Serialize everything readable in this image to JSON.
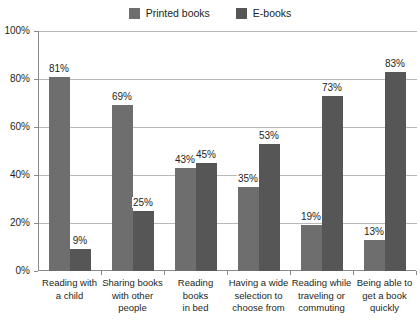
{
  "legend": {
    "items": [
      {
        "label": "Printed books",
        "color": "#6e6e6e",
        "swatch_name": "legend-swatch-printed"
      },
      {
        "label": "E-books",
        "color": "#565656",
        "swatch_name": "legend-swatch-ebooks"
      }
    ]
  },
  "axis": {
    "y_ticks": [
      "0%",
      "20%",
      "40%",
      "60%",
      "80%",
      "100%"
    ]
  },
  "chart_data": {
    "type": "bar",
    "title": "",
    "subtitle": "",
    "xlabel": "",
    "ylabel": "",
    "ylim": [
      0,
      100
    ],
    "grid": true,
    "legend_position": "top-center",
    "categories": [
      "Reading with a child",
      "Sharing books with other people",
      "Reading books in bed",
      "Having a wide selection to choose from",
      "Reading while traveling or commuting",
      "Being able to get a book quickly"
    ],
    "category_lines": [
      [
        "Reading with",
        "a child"
      ],
      [
        "Sharing books",
        "with other",
        "people"
      ],
      [
        "Reading books",
        "in bed"
      ],
      [
        "Having a wide",
        "selection to",
        "choose from"
      ],
      [
        "Reading while",
        "traveling or",
        "commuting"
      ],
      [
        "Being able to",
        "get a book",
        "quickly"
      ]
    ],
    "series": [
      {
        "name": "Printed books",
        "color": "#6e6e6e",
        "values": [
          81,
          69,
          43,
          35,
          19,
          13
        ],
        "labels": [
          "81%",
          "69%",
          "43%",
          "35%",
          "19%",
          "13%"
        ]
      },
      {
        "name": "E-books",
        "color": "#565656",
        "values": [
          9,
          25,
          45,
          53,
          73,
          83
        ],
        "labels": [
          "9%",
          "25%",
          "45%",
          "53%",
          "73%",
          "83%"
        ]
      }
    ]
  }
}
